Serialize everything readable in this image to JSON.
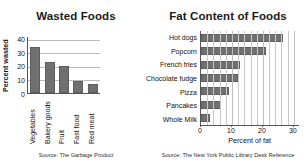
{
  "chart_data": [
    {
      "type": "bar",
      "title": "Wasted Foods",
      "orientation": "vertical",
      "categories": [
        "Vegetables",
        "Bakery goods",
        "Fruit",
        "Fast food",
        "Red meat"
      ],
      "values": [
        34,
        23,
        20,
        9,
        6.5
      ],
      "xlabel": "",
      "ylabel": "Percent wasted",
      "ylim": [
        0,
        42
      ],
      "yticks": [
        0,
        10,
        20,
        30,
        40
      ],
      "ytick_labels": [
        "0",
        "10",
        "20",
        "30",
        "40"
      ],
      "grid": "horizontal",
      "legend": "none",
      "bar_color": "#707070",
      "source": "Source: The Garbage Product"
    },
    {
      "type": "bar",
      "title": "Fat Content of Foods",
      "orientation": "horizontal",
      "categories": [
        "Hot dogs",
        "Popcorn",
        "French fries",
        "Chocolate fudge",
        "Pizza",
        "Pancakes",
        "Whole Milk"
      ],
      "values": [
        26.5,
        21,
        12.5,
        12,
        9,
        6.5,
        3
      ],
      "xlabel": "Percent of fat",
      "ylabel": "",
      "xlim": [
        0,
        32
      ],
      "xticks": [
        0,
        10,
        20,
        30
      ],
      "xtick_labels": [
        "0",
        "10",
        "20",
        "30"
      ],
      "grid": "vertical",
      "legend": "none",
      "bar_color": "#707070",
      "source": "Source: The New York Public Library Desk Reference"
    }
  ],
  "left_chart": {
    "title": "Wasted Foods",
    "ylabel": "Percent wasted",
    "source": "Source: The Garbage Product",
    "yticks": [
      "40",
      "30",
      "20",
      "10",
      "0"
    ],
    "categories": [
      "Vegetables",
      "Bakery goods",
      "Fruit",
      "Fast food",
      "Red meat"
    ]
  },
  "right_chart": {
    "title": "Fat Content of Foods",
    "xlabel": "Percent of fat",
    "source": "Source: The New York Public Library Desk Reference",
    "xticks": [
      "0",
      "10",
      "20",
      "30"
    ],
    "categories": [
      "Hot dogs",
      "Popcorn",
      "French fries",
      "Chocolate fudge",
      "Pizza",
      "Pancakes",
      "Whole Milk"
    ]
  }
}
